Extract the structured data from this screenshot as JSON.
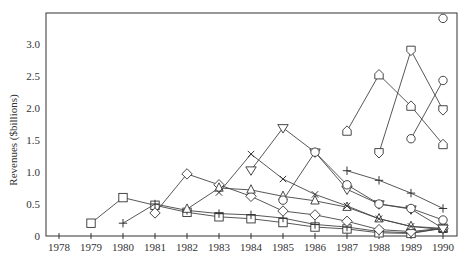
{
  "chart_data": {
    "type": "line",
    "title": "",
    "xlabel": "",
    "ylabel": "Revenues ($billions)",
    "xlim": [
      1977.6,
      1990.45
    ],
    "ylim": [
      0,
      3.5
    ],
    "x_ticks": [
      1978,
      1979,
      1980,
      1981,
      1982,
      1983,
      1984,
      1985,
      1986,
      1987,
      1988,
      1989,
      1990
    ],
    "x_tick_labels": [
      "1978",
      "1979",
      "1980",
      "1981",
      "1982",
      "1983",
      "1984",
      "1985",
      "1986",
      "1987",
      "1988",
      "1989",
      "1990"
    ],
    "y_ticks": [
      0,
      0.5,
      1.0,
      1.5,
      2.0,
      2.5,
      3.0
    ],
    "y_tick_labels": [
      "0",
      "0.5",
      "1.0",
      "1.5",
      "2.0",
      "2.5",
      "3.0"
    ],
    "grid": false,
    "legend": "none",
    "series": [
      {
        "name": "Series A",
        "marker": "square",
        "x": [
          1979,
          1980,
          1981,
          1982,
          1983,
          1984,
          1985,
          1986,
          1987,
          1988,
          1989,
          1990
        ],
        "values": [
          0.2,
          0.6,
          0.48,
          0.37,
          0.3,
          0.27,
          0.21,
          0.14,
          0.11,
          0.05,
          0.04,
          0.12
        ]
      },
      {
        "name": "Series B",
        "marker": "plus",
        "x": [
          1980,
          1981,
          1982,
          1983,
          1984,
          1985,
          1986,
          1987,
          1988,
          1989,
          1990
        ],
        "values": [
          0.2,
          0.5,
          0.4,
          0.35,
          0.33,
          0.28,
          0.18,
          0.14,
          0.07,
          0.05,
          0.12
        ]
      },
      {
        "name": "Series C",
        "marker": "diamond",
        "x": [
          1981,
          1982,
          1983,
          1984,
          1985,
          1986,
          1987,
          1988,
          1989,
          1990
        ],
        "values": [
          0.36,
          0.97,
          0.8,
          0.62,
          0.39,
          0.33,
          0.23,
          0.1,
          0.07,
          0.12
        ]
      },
      {
        "name": "Series D",
        "marker": "triangle-up",
        "x": [
          1982,
          1983,
          1984,
          1985,
          1986,
          1987,
          1988,
          1989,
          1990
        ],
        "values": [
          0.42,
          0.75,
          0.72,
          0.62,
          0.55,
          0.45,
          0.27,
          0.15,
          0.12
        ]
      },
      {
        "name": "Series E",
        "marker": "x",
        "x": [
          1983,
          1984,
          1985,
          1986,
          1987,
          1988,
          1989,
          1990
        ],
        "values": [
          0.68,
          1.28,
          0.89,
          0.65,
          0.47,
          0.27,
          0.15,
          0.1
        ]
      },
      {
        "name": "Series F",
        "marker": "triangle-down",
        "x": [
          1984,
          1985,
          1986,
          1987,
          1988,
          1989,
          1990
        ],
        "values": [
          1.03,
          1.69,
          1.31,
          0.73,
          0.5,
          0.42,
          0.12
        ]
      },
      {
        "name": "Series G",
        "marker": "circle",
        "x": [
          1985,
          1986,
          1987,
          1988,
          1989,
          1990
        ],
        "values": [
          0.56,
          1.31,
          0.8,
          0.5,
          0.43,
          0.25
        ]
      },
      {
        "name": "Series H",
        "marker": "plus",
        "x": [
          1987,
          1988,
          1989,
          1990
        ],
        "values": [
          1.02,
          0.87,
          0.67,
          0.43
        ]
      },
      {
        "name": "Series I",
        "marker": "pentagon-up",
        "x": [
          1987,
          1988,
          1989,
          1990
        ],
        "values": [
          1.64,
          2.52,
          2.03,
          1.43
        ]
      },
      {
        "name": "Series J",
        "marker": "pentagon-down",
        "x": [
          1988,
          1989,
          1990
        ],
        "values": [
          1.3,
          2.9,
          1.97
        ]
      },
      {
        "name": "Series K",
        "marker": "circle",
        "x": [
          1989,
          1990
        ],
        "values": [
          1.52,
          2.43
        ]
      },
      {
        "name": "Series L",
        "marker": "circle",
        "x": [
          1990
        ],
        "values": [
          3.4
        ]
      }
    ]
  }
}
